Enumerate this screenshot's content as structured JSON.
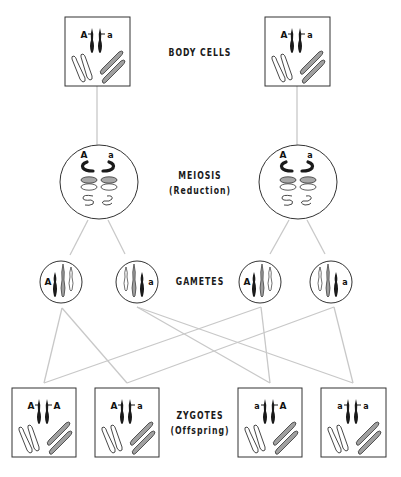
{
  "labels": {
    "body_cells": "BODY CELLS",
    "meiosis": "MEIOSIS",
    "meiosis_sub": "(Reduction)",
    "gametes": "GAMETES",
    "zygotes": "ZYGOTES",
    "zygotes_sub": "(Offspring)"
  },
  "colors": {
    "line": "#c8c8c8",
    "outline": "#333333",
    "dark_chromosome": "#1a1a1a",
    "gray_chromosome": "#9a9a9a",
    "light_chromosome": "#ffffff"
  },
  "body_cells": [
    {
      "left_allele": "A",
      "right_allele": "a"
    },
    {
      "left_allele": "A",
      "right_allele": "a"
    }
  ],
  "meiosis_cells": [
    {
      "left_allele": "A",
      "right_allele": "a"
    },
    {
      "left_allele": "A",
      "right_allele": "a"
    }
  ],
  "gametes": [
    {
      "allele": "A",
      "side": "left"
    },
    {
      "allele": "a",
      "side": "right"
    },
    {
      "allele": "A",
      "side": "left"
    },
    {
      "allele": "a",
      "side": "right"
    }
  ],
  "zygotes": [
    {
      "left_allele": "A",
      "right_allele": "A"
    },
    {
      "left_allele": "A",
      "right_allele": "a"
    },
    {
      "left_allele": "a",
      "right_allele": "A"
    },
    {
      "left_allele": "a",
      "right_allele": "a"
    }
  ]
}
